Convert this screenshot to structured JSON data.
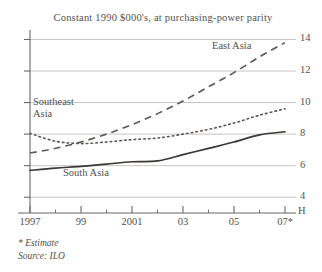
{
  "chart_data": {
    "type": "line",
    "title": "Constant 1990 $000's, at purchasing-power parity",
    "xlabel": "",
    "ylabel": "",
    "yunit": "H",
    "ylim": [
      3.0,
      14.6
    ],
    "xlim": [
      1997,
      2007
    ],
    "grid": true,
    "gridlines": [
      4,
      6,
      8,
      10,
      12,
      14
    ],
    "legend_position": "inline-annotations",
    "yticks": [
      14,
      12,
      10,
      8,
      6,
      4
    ],
    "ytick_labels": [
      "14",
      "12",
      "10",
      "8",
      "6",
      "4"
    ],
    "x": [
      1997,
      1998,
      1999,
      2000,
      2001,
      2002,
      2003,
      2004,
      2005,
      2006,
      2007
    ],
    "xtick_values": [
      1997,
      1999,
      2001,
      2003,
      2005,
      2007
    ],
    "xtick_labels": [
      "1997",
      "99",
      "2001",
      "03",
      "05",
      "07*"
    ],
    "series": [
      {
        "name": "East Asia",
        "style": "dashed",
        "color": "#5b5754",
        "values": [
          6.8,
          7.1,
          7.5,
          8.0,
          8.6,
          9.3,
          10.1,
          11.0,
          11.9,
          12.9,
          13.8
        ]
      },
      {
        "name": "Southeast Asia",
        "style": "dotted",
        "color": "#5b5754",
        "values": [
          8.05,
          7.55,
          7.4,
          7.5,
          7.65,
          7.75,
          8.0,
          8.3,
          8.7,
          9.2,
          9.6
        ]
      },
      {
        "name": "South Asia",
        "style": "solid",
        "color": "#3a3735",
        "values": [
          5.7,
          5.85,
          5.95,
          6.1,
          6.25,
          6.3,
          6.7,
          7.1,
          7.5,
          7.95,
          8.15
        ]
      }
    ],
    "annotations": [
      {
        "text": "Southeast\nAsia",
        "series": "Southeast Asia"
      },
      {
        "text": "East Asia",
        "series": "East Asia"
      },
      {
        "text": "South Asia",
        "series": "South Asia"
      }
    ],
    "footnotes": [
      "* Estimate",
      "Source: ILO"
    ]
  },
  "footnotes": {
    "estimate": "* Estimate",
    "source": "Source: ILO"
  }
}
